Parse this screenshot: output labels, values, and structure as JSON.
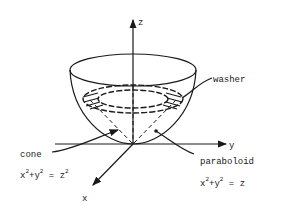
{
  "diagram": {
    "axes": {
      "x": "x",
      "y": "y",
      "z": "z"
    },
    "labels": {
      "washer": "washer",
      "cone": "cone",
      "cone_eq_a": "x",
      "cone_eq_b": "+y",
      "cone_eq_c": " = z",
      "paraboloid": "paraboloid",
      "para_eq_a": "x",
      "para_eq_b": "+y",
      "para_eq_c": " = z",
      "exp": "2"
    },
    "colors": {
      "ink": "#1a1a1a",
      "background": "#ffffff"
    }
  }
}
